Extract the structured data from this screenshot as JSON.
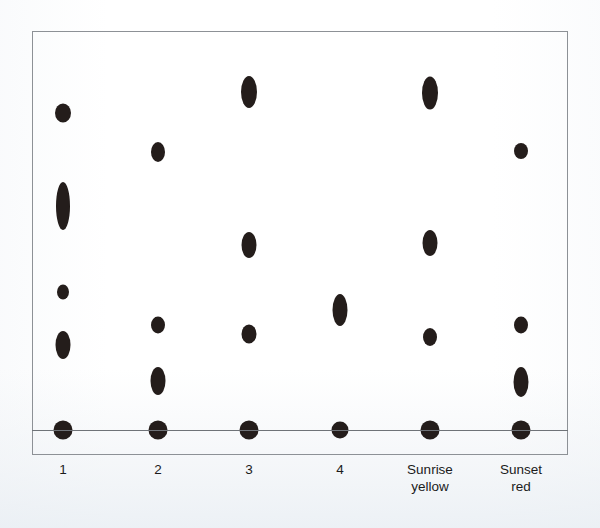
{
  "figure": {
    "title": "",
    "frame": {
      "x": 32,
      "y": 31,
      "width": 536,
      "height": 424,
      "border_color": "#8d9196"
    },
    "baseline": {
      "y": 430,
      "color": "#6f7378"
    },
    "marker_color": "#241d1b",
    "background_color": "#ffffff"
  },
  "chart_data": {
    "type": "scatter",
    "title": "",
    "xlabel": "",
    "ylabel": "",
    "grid": false,
    "legend": "none",
    "categories": [
      "1",
      "2",
      "3",
      "4",
      "Sunrise yellow",
      "Sunset red"
    ],
    "category_labels_multiline": [
      "1",
      "2",
      "3",
      "4",
      "Sunrise\nyellow",
      "Sunset\nred"
    ],
    "category_x_px": [
      63,
      158,
      249,
      340,
      430,
      521
    ],
    "ylim_px": [
      31,
      455
    ],
    "baseline_y_px": 430,
    "note": "Vertical one-dimensional dot/strip plot; marker vertical extent encodes spread. y given in pixel coordinates from top of image.",
    "series": [
      {
        "name": "1",
        "x_px": 63,
        "points": [
          {
            "y_px": 113,
            "w_px": 16,
            "h_px": 19
          },
          {
            "y_px": 206,
            "w_px": 14,
            "h_px": 48
          },
          {
            "y_px": 292,
            "w_px": 12,
            "h_px": 15
          },
          {
            "y_px": 345,
            "w_px": 15,
            "h_px": 28
          },
          {
            "y_px": 430,
            "w_px": 19,
            "h_px": 19
          }
        ]
      },
      {
        "name": "2",
        "x_px": 158,
        "points": [
          {
            "y_px": 152,
            "w_px": 14,
            "h_px": 20
          },
          {
            "y_px": 325,
            "w_px": 14,
            "h_px": 17
          },
          {
            "y_px": 381,
            "w_px": 15,
            "h_px": 28
          },
          {
            "y_px": 430,
            "w_px": 19,
            "h_px": 19
          }
        ]
      },
      {
        "name": "3",
        "x_px": 249,
        "points": [
          {
            "y_px": 92,
            "w_px": 16,
            "h_px": 32
          },
          {
            "y_px": 245,
            "w_px": 15,
            "h_px": 26
          },
          {
            "y_px": 334,
            "w_px": 15,
            "h_px": 19
          },
          {
            "y_px": 430,
            "w_px": 19,
            "h_px": 19
          }
        ]
      },
      {
        "name": "4",
        "x_px": 340,
        "points": [
          {
            "y_px": 310,
            "w_px": 15,
            "h_px": 32
          },
          {
            "y_px": 430,
            "w_px": 17,
            "h_px": 17
          }
        ]
      },
      {
        "name": "Sunrise yellow",
        "x_px": 430,
        "points": [
          {
            "y_px": 93,
            "w_px": 16,
            "h_px": 33
          },
          {
            "y_px": 243,
            "w_px": 15,
            "h_px": 26
          },
          {
            "y_px": 337,
            "w_px": 14,
            "h_px": 18
          },
          {
            "y_px": 430,
            "w_px": 19,
            "h_px": 19
          }
        ]
      },
      {
        "name": "Sunset red",
        "x_px": 521,
        "points": [
          {
            "y_px": 151,
            "w_px": 14,
            "h_px": 16
          },
          {
            "y_px": 325,
            "w_px": 14,
            "h_px": 17
          },
          {
            "y_px": 382,
            "w_px": 15,
            "h_px": 30
          },
          {
            "y_px": 430,
            "w_px": 19,
            "h_px": 19
          }
        ]
      }
    ]
  }
}
